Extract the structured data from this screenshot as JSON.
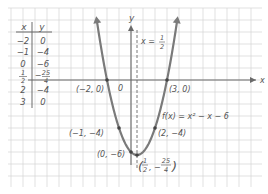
{
  "chart_data": {
    "type": "line",
    "title": "",
    "function_label": "f(x) = x² − x − 6",
    "xlabel": "x",
    "ylabel": "y",
    "origin_label": "0",
    "axis_of_symmetry_label": "x = 1/2",
    "xlim": [
      -10,
      11
    ],
    "ylim": [
      -8.8,
      6.5
    ],
    "grid": true,
    "table": {
      "headers": [
        "x",
        "y"
      ],
      "rows": [
        {
          "x": "-2",
          "y": "0"
        },
        {
          "x": "-1",
          "y": "-4"
        },
        {
          "x": "0",
          "y": "-6"
        },
        {
          "x": "1/2",
          "y": "-25/4"
        },
        {
          "x": "2",
          "y": "-4"
        },
        {
          "x": "3",
          "y": "0"
        }
      ]
    },
    "series": [
      {
        "name": "f(x) = x^2 - x - 6",
        "x": [
          -2,
          -1,
          0,
          0.5,
          2,
          3
        ],
        "y": [
          0,
          -4,
          -6,
          -6.25,
          -4,
          0
        ]
      }
    ],
    "annotations": [
      {
        "point": [
          -2,
          0
        ],
        "label": "(−2, 0)"
      },
      {
        "point": [
          3,
          0
        ],
        "label": "(3, 0)"
      },
      {
        "point": [
          -1,
          -4
        ],
        "label": "(−1, −4)"
      },
      {
        "point": [
          2,
          -4
        ],
        "label": "(2, −4)"
      },
      {
        "point": [
          0,
          -6
        ],
        "label": "(0, −6)"
      },
      {
        "point": [
          0.5,
          -6.25
        ],
        "label": "(1/2, −25/4)"
      }
    ]
  },
  "colors": {
    "grid": "#d4d4d4",
    "axis": "#6a6a6a",
    "curve": "#7a7a7a",
    "text": "#555555"
  }
}
